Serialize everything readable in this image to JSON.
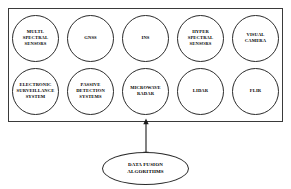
{
  "diagram": {
    "colors": {
      "background": "#ffffff",
      "stroke": "#2b2b2b",
      "box_stroke": "#3a3a3a",
      "text": "#000000"
    },
    "sensor_box": {
      "name": "sensor-suite-container"
    },
    "rows": [
      {
        "name": "sensor-row-1",
        "nodes": [
          {
            "id": "multi-spectral-sensors",
            "label": "MULTI-\nSPECTRAL\nSENSORS"
          },
          {
            "id": "gnss",
            "label": "GNSS"
          },
          {
            "id": "ins",
            "label": "INS"
          },
          {
            "id": "hyper-spectral-sensors",
            "label": "HYPER\nSPECTRAL\nSENSORS"
          },
          {
            "id": "visual-camera",
            "label": "VISUAL\nCAMERA"
          }
        ]
      },
      {
        "name": "sensor-row-2",
        "nodes": [
          {
            "id": "electronic-surveillance-system",
            "label": "ELECTRONIC\nSURVEILLANCE\nSYSTEM"
          },
          {
            "id": "passive-detection-systems",
            "label": "PASSIVE\nDETECTION\nSYSTEMS"
          },
          {
            "id": "microwave-radar",
            "label": "MICROWAVE\nRADAR"
          },
          {
            "id": "lidar",
            "label": "LIDAR"
          },
          {
            "id": "flir",
            "label": "FLIR"
          }
        ]
      }
    ],
    "connector": {
      "name": "bidirectional-arrow",
      "style": "double-headed-vertical"
    },
    "fusion_node": {
      "id": "data-fusion-algorithms",
      "label": "DATA FUSION\nALGORITHMS"
    }
  }
}
